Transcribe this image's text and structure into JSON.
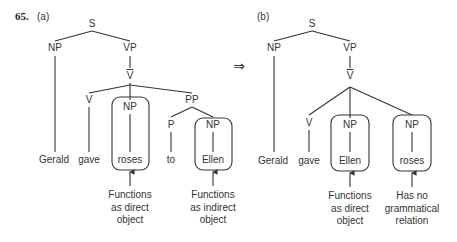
{
  "example_number": "65.",
  "transform_arrow": "⇒",
  "colors": {
    "line": "#333333",
    "text": "#333333"
  },
  "tree_a": {
    "label": "(a)",
    "nodes": {
      "s": "S",
      "np_subject": "NP",
      "vp": "VP",
      "vbar": "V",
      "v": "V",
      "np_object": "NP",
      "pp": "PP",
      "p": "P",
      "np_pp": "NP"
    },
    "leaves": [
      "Gerald",
      "gave",
      "roses",
      "to",
      "Ellen"
    ],
    "annotations": [
      {
        "target": "roses",
        "lines": [
          "Functions",
          "as direct",
          "object"
        ]
      },
      {
        "target": "Ellen",
        "lines": [
          "Functions",
          "as indirect",
          "object"
        ]
      }
    ]
  },
  "tree_b": {
    "label": "(b)",
    "nodes": {
      "s": "S",
      "np_subject": "NP",
      "vp": "VP",
      "vbar": "V",
      "v": "V",
      "np_first": "NP",
      "np_second": "NP"
    },
    "leaves": [
      "Gerald",
      "gave",
      "Ellen",
      "roses"
    ],
    "annotations": [
      {
        "target": "Ellen",
        "lines": [
          "Functions",
          "as direct",
          "object"
        ]
      },
      {
        "target": "roses",
        "lines": [
          "Has no",
          "grammatical",
          "relation"
        ]
      }
    ]
  }
}
